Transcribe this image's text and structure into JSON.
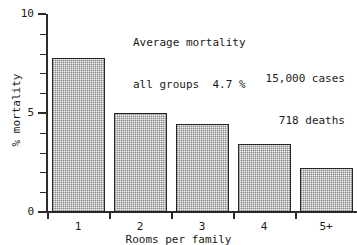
{
  "chart_data": {
    "type": "bar",
    "title": "",
    "categories": [
      "1",
      "2",
      "3",
      "4",
      "5+"
    ],
    "values": [
      7.8,
      5.0,
      4.45,
      3.45,
      2.2
    ],
    "xlabel": "Rooms per family",
    "ylabel": "% mortality",
    "ylim": [
      0,
      10
    ],
    "yticks_major": [
      0,
      5,
      10
    ],
    "yticks_major_labels": [
      "0",
      "5",
      "10"
    ],
    "yticks_minor": [
      1,
      2,
      3,
      4,
      6,
      7,
      8,
      9
    ],
    "grid": false,
    "legend": "none",
    "annotations": [
      {
        "name": "average-mortality-note",
        "position": "top-center",
        "lines": [
          "Average mortality",
          "all groups  4.7 %"
        ]
      },
      {
        "name": "counts-note",
        "position": "top-right",
        "lines": [
          "15,000 cases",
          "718 deaths"
        ]
      }
    ],
    "colors": {
      "bar_fill": "#f2f2f2",
      "bar_edge": "#262626",
      "axis": "#2b2b2b",
      "text": "#1a1a1a",
      "background": "#ffffff"
    }
  },
  "annotations": {
    "average": {
      "line1": "Average mortality",
      "line2": "all groups  4.7 %"
    },
    "counts": {
      "line1": "15,000 cases",
      "line2": "718 deaths"
    }
  },
  "axes": {
    "ylabel": "% mortality",
    "xlabel": "Rooms per family",
    "ytick_labels": [
      "0",
      "5",
      "10"
    ],
    "xtick_labels": [
      "1",
      "2",
      "3",
      "4",
      "5+"
    ]
  }
}
